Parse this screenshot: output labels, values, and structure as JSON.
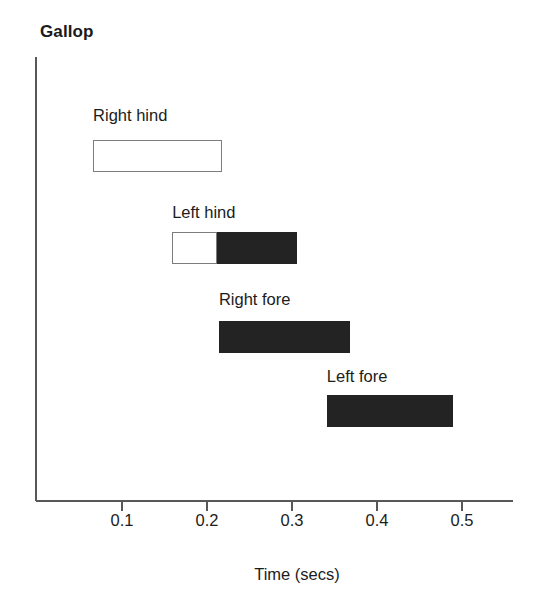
{
  "chart_data": {
    "type": "bar",
    "orientation": "horizontal-gantt",
    "title": "Gallop",
    "xlabel": "Time (secs)",
    "ylabel": "",
    "xlim": [
      0.0,
      0.56
    ],
    "xticks": [
      0.1,
      0.2,
      0.3,
      0.4,
      0.5
    ],
    "xtick_labels": [
      "0.1",
      "0.2",
      "0.3",
      "0.4",
      "0.5"
    ],
    "grid": false,
    "legend": null,
    "categories": [
      "Right hind",
      "Left hind",
      "Right fore",
      "Left fore"
    ],
    "bars": [
      {
        "label": "Right hind",
        "start": 0.066,
        "end": 0.218,
        "duration": 0.152,
        "segments": [
          {
            "style": "open",
            "start": 0.066,
            "end": 0.218
          }
        ]
      },
      {
        "label": "Left hind",
        "start": 0.159,
        "end": 0.306,
        "duration": 0.147,
        "segments": [
          {
            "style": "open",
            "start": 0.159,
            "end": 0.212
          },
          {
            "style": "filled",
            "start": 0.212,
            "end": 0.306
          }
        ]
      },
      {
        "label": "Right fore",
        "start": 0.214,
        "end": 0.368,
        "duration": 0.154,
        "segments": [
          {
            "style": "filled",
            "start": 0.214,
            "end": 0.368
          }
        ]
      },
      {
        "label": "Left fore",
        "start": 0.341,
        "end": 0.489,
        "duration": 0.148,
        "segments": [
          {
            "style": "filled",
            "start": 0.341,
            "end": 0.489
          }
        ]
      }
    ]
  },
  "colors": {
    "axis": "#585858",
    "filled_bar": "#232323",
    "open_bar_border": "#7d7d7d",
    "open_bar_fill": "#ffffff",
    "text": "#1c1c1c",
    "background": "#ffffff"
  },
  "layout": {
    "axis_origin_x": 36,
    "axis_top_y": 57,
    "axis_baseline_y": 501,
    "axis_right_x": 513,
    "px_per_unit": 850,
    "x_at_zero": 37,
    "tick_length": 10,
    "bar_height": 32,
    "rows": [
      {
        "bar_top": 140,
        "label_baseline": 120
      },
      {
        "bar_top": 232,
        "label_baseline": 217
      },
      {
        "bar_top": 321,
        "label_baseline": 304
      },
      {
        "bar_top": 395,
        "label_baseline": 381
      }
    ],
    "tick_label_top": 512,
    "axis_title_top": 566,
    "axis_title_center_x": 297
  }
}
